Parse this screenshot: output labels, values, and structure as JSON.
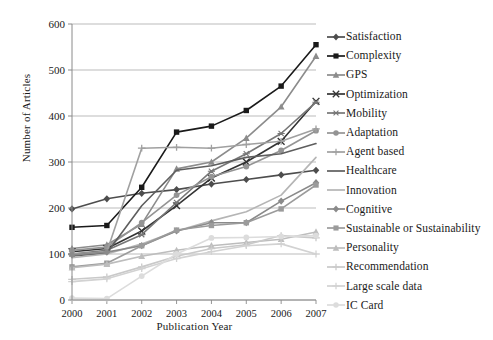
{
  "chart_data": {
    "type": "line",
    "title": "",
    "xlabel": "Publication Year",
    "ylabel": "Number of Articles",
    "x": [
      2000,
      2001,
      2002,
      2003,
      2004,
      2005,
      2006,
      2007
    ],
    "categories": [
      "2000",
      "2001",
      "2002",
      "2003",
      "2004",
      "2005",
      "2006",
      "2007"
    ],
    "xtick_labels": [
      "2000",
      "2001",
      "2002",
      "2003",
      "2004",
      "2005",
      "2006",
      "2007"
    ],
    "ytick_labels": [
      "0",
      "100",
      "200",
      "300",
      "400",
      "500",
      "600"
    ],
    "yticks": [
      0,
      100,
      200,
      300,
      400,
      500,
      600
    ],
    "ylim": [
      0,
      600
    ],
    "grid": "horizontal",
    "legend_position": "right",
    "series": [
      {
        "name": "Satisfaction",
        "marker": "diamond",
        "color": "#4d4d4d",
        "values": [
          198,
          220,
          232,
          240,
          252,
          262,
          272,
          282
        ]
      },
      {
        "name": "Complexity",
        "marker": "square",
        "color": "#1a1a1a",
        "values": [
          158,
          162,
          245,
          365,
          378,
          412,
          465,
          555
        ]
      },
      {
        "name": "GPS",
        "marker": "triangle",
        "color": "#8c8c8c",
        "values": [
          112,
          120,
          165,
          285,
          300,
          352,
          420,
          530
        ]
      },
      {
        "name": "Optimization",
        "marker": "cross",
        "color": "#333333",
        "values": [
          105,
          112,
          150,
          205,
          265,
          300,
          345,
          432
        ]
      },
      {
        "name": "Mobility",
        "marker": "star",
        "color": "#777777",
        "values": [
          100,
          108,
          142,
          212,
          280,
          318,
          362,
          430
        ]
      },
      {
        "name": "Adaptation",
        "marker": "circle",
        "color": "#949494",
        "values": [
          108,
          115,
          168,
          228,
          268,
          290,
          325,
          368
        ]
      },
      {
        "name": "Agent based",
        "marker": "plus",
        "color": "#a0a0a0",
        "values": [
          100,
          105,
          330,
          332,
          330,
          338,
          345,
          372
        ]
      },
      {
        "name": "Healthcare",
        "marker": "none",
        "color": "#5e5e5e",
        "values": [
          96,
          102,
          205,
          282,
          292,
          310,
          318,
          340
        ]
      },
      {
        "name": "Innovation",
        "marker": "none",
        "color": "#b5b5b5",
        "values": [
          92,
          100,
          122,
          150,
          172,
          192,
          228,
          310
        ]
      },
      {
        "name": "Cognitive",
        "marker": "diamond",
        "color": "#8a8a8a",
        "values": [
          98,
          104,
          118,
          150,
          168,
          168,
          215,
          255
        ]
      },
      {
        "name": "Sustainable or Sustainability",
        "marker": "square",
        "color": "#9b9b9b",
        "values": [
          72,
          80,
          118,
          152,
          162,
          168,
          198,
          250
        ]
      },
      {
        "name": "Personality",
        "marker": "triangle",
        "color": "#bdbdbd",
        "values": [
          70,
          78,
          95,
          108,
          118,
          125,
          132,
          148
        ]
      },
      {
        "name": "Recommendation",
        "marker": "plus",
        "color": "#c9c9c9",
        "values": [
          45,
          50,
          72,
          95,
          112,
          120,
          140,
          135
        ]
      },
      {
        "name": "Large scale data",
        "marker": "plus",
        "color": "#d2d2d2",
        "values": [
          40,
          46,
          68,
          90,
          105,
          118,
          122,
          100
        ]
      },
      {
        "name": "IC Card",
        "marker": "circle",
        "color": "#dcdcdc",
        "values": [
          4,
          3,
          52,
          100,
          135,
          136,
          138,
          140
        ]
      }
    ]
  }
}
